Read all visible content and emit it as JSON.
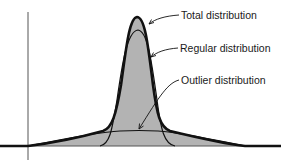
{
  "diagram": {
    "type": "distribution-decomposition",
    "labels": {
      "total": "Total distribution",
      "regular": "Regular distribution",
      "outlier": "Outlier distribution"
    },
    "colors": {
      "fill": "#b3b3b3",
      "stroke": "#111111",
      "axis": "#555555",
      "background": "#ffffff"
    },
    "curves": [
      {
        "name": "Total distribution",
        "style": "thick",
        "peak": "tall, narrow",
        "tails": "heavy"
      },
      {
        "name": "Regular distribution",
        "style": "thin",
        "peak": "narrow, slightly lower"
      },
      {
        "name": "Outlier distribution",
        "style": "thin",
        "peak": "broad, low, flat"
      }
    ]
  }
}
